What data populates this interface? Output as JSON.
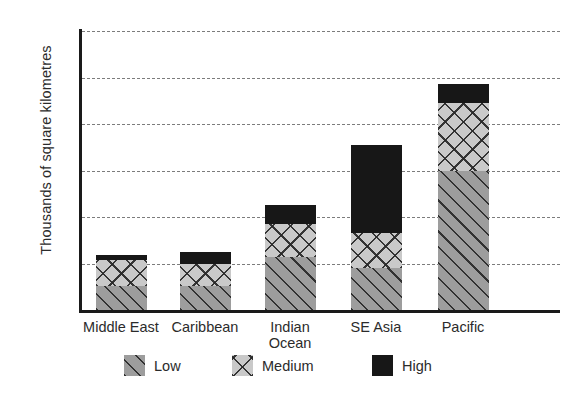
{
  "chart_data": {
    "type": "bar",
    "subtype": "stacked-bar",
    "title": "",
    "xlabel": "",
    "ylabel": "Thousands of square kilometres",
    "ylim": [
      0,
      120
    ],
    "yticks": [
      0,
      20,
      40,
      60,
      80,
      100,
      120
    ],
    "ytick_labels": [
      "0",
      "20",
      "40",
      "60",
      "80",
      "100",
      "120"
    ],
    "grid": "horizontal-dashed",
    "legend_position": "bottom",
    "categories": [
      "Middle East",
      "Caribbean",
      "Indian Ocean",
      "SE Asia",
      "Pacific"
    ],
    "category_lines": [
      [
        "Middle East"
      ],
      [
        "Caribbean"
      ],
      [
        "Indian",
        "Ocean"
      ],
      [
        "SE Asia"
      ],
      [
        "Pacific"
      ]
    ],
    "series": [
      {
        "name": "Low",
        "values": [
          10.5,
          10.5,
          23,
          18,
          60
        ],
        "pattern": "diagonal-hatch",
        "color": "#9d9d9d"
      },
      {
        "name": "Medium",
        "values": [
          11,
          9.5,
          14,
          15,
          29
        ],
        "pattern": "cross-hatch",
        "color": "#c9c9c9"
      },
      {
        "name": "High",
        "values": [
          2,
          5,
          8,
          38,
          8
        ],
        "pattern": "solid",
        "color": "#171717"
      }
    ],
    "totals": [
      23.5,
      25,
      45,
      71,
      97
    ]
  },
  "legend": {
    "items": [
      {
        "label": "Low"
      },
      {
        "label": "Medium"
      },
      {
        "label": "High"
      }
    ]
  }
}
